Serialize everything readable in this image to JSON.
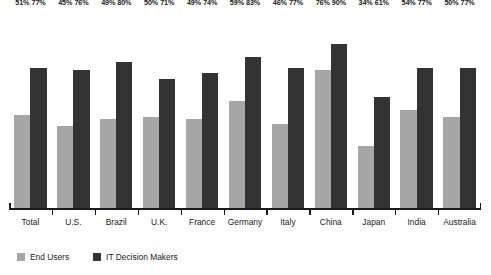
{
  "chart_data": {
    "type": "bar",
    "title": "",
    "subtitle": "",
    "xlabel": "",
    "ylabel": "",
    "ylim": [
      0,
      100
    ],
    "grid": false,
    "legend_position": "bottom-left",
    "value_suffix": "%",
    "categories": [
      "Total",
      "U.S.",
      "Brazil",
      "U.K.",
      "France",
      "Germany",
      "Italy",
      "China",
      "Japan",
      "India",
      "Australia"
    ],
    "series": [
      {
        "name": "End Users",
        "color": "#a6a6a6",
        "values": [
          51,
          45,
          49,
          50,
          49,
          59,
          46,
          76,
          34,
          54,
          50
        ],
        "labels": [
          "51%",
          "45%",
          "49%",
          "50%",
          "49%",
          "59%",
          "46%",
          "76%",
          "34%",
          "54%",
          "50%"
        ]
      },
      {
        "name": "IT Decision Makers",
        "color": "#333333",
        "values": [
          77,
          76,
          80,
          71,
          74,
          83,
          77,
          90,
          61,
          77,
          77
        ],
        "labels": [
          "77%",
          "76%",
          "80%",
          "71%",
          "74%",
          "83%",
          "77%",
          "90%",
          "61%",
          "77%",
          "77%"
        ]
      }
    ]
  },
  "legend": {
    "items": [
      {
        "label": "End Users",
        "color": "#a6a6a6"
      },
      {
        "label": "IT Decision Makers",
        "color": "#333333"
      }
    ]
  },
  "axis": {
    "baseline_color": "#1a1a1a"
  }
}
